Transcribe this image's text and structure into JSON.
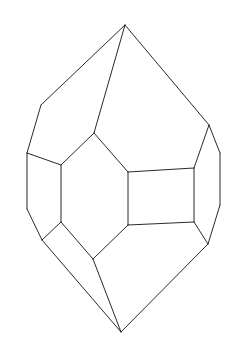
{
  "figure": {
    "stroke_color": "#2a2a2a",
    "background_color": "#ffffff",
    "vertices": {
      "top_apex": [
        125,
        25
      ],
      "left_shoulder": [
        41,
        105
      ],
      "left_upper": [
        27,
        153
      ],
      "left_lower": [
        27,
        209
      ],
      "left_bottom": [
        42,
        240
      ],
      "hex_top": [
        94,
        133
      ],
      "hex_top_left": [
        61,
        165
      ],
      "hex_bottom_left": [
        61,
        222
      ],
      "hex_bottom": [
        93,
        259
      ],
      "rect_top_left": [
        128,
        172
      ],
      "rect_top_right": [
        194,
        168
      ],
      "rect_bottom_right": [
        194,
        222
      ],
      "rect_bottom_left": [
        128,
        225
      ],
      "right_shoulder": [
        209,
        125
      ],
      "right_upper": [
        220,
        153
      ],
      "right_lower": [
        220,
        205
      ],
      "right_bottom": [
        208,
        244
      ],
      "bottom_apex": [
        121,
        332
      ]
    },
    "edges": [
      [
        "top_apex",
        "left_shoulder"
      ],
      [
        "top_apex",
        "hex_top"
      ],
      [
        "top_apex",
        "right_shoulder"
      ],
      [
        "left_shoulder",
        "left_upper"
      ],
      [
        "left_upper",
        "left_lower"
      ],
      [
        "left_lower",
        "left_bottom"
      ],
      [
        "left_upper",
        "hex_top_left"
      ],
      [
        "hex_top",
        "hex_top_left"
      ],
      [
        "hex_top_left",
        "hex_bottom_left"
      ],
      [
        "hex_bottom_left",
        "left_bottom"
      ],
      [
        "hex_bottom_left",
        "hex_bottom"
      ],
      [
        "hex_top",
        "rect_top_left"
      ],
      [
        "rect_top_left",
        "rect_top_right"
      ],
      [
        "rect_top_right",
        "rect_bottom_right"
      ],
      [
        "rect_bottom_right",
        "rect_bottom_left"
      ],
      [
        "rect_bottom_left",
        "rect_top_left"
      ],
      [
        "rect_bottom_left",
        "hex_bottom"
      ],
      [
        "rect_top_right",
        "right_shoulder"
      ],
      [
        "right_shoulder",
        "right_upper"
      ],
      [
        "right_upper",
        "right_lower"
      ],
      [
        "right_lower",
        "right_bottom"
      ],
      [
        "rect_bottom_right",
        "right_bottom"
      ],
      [
        "left_bottom",
        "bottom_apex"
      ],
      [
        "hex_bottom",
        "bottom_apex"
      ],
      [
        "right_bottom",
        "bottom_apex"
      ]
    ]
  }
}
